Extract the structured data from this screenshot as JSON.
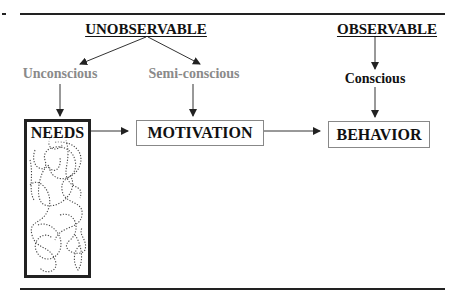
{
  "diagram": {
    "headers": {
      "unobservable": "UNOBSERVABLE",
      "observable": "OBSERVABLE"
    },
    "levels": {
      "unconscious": "Unconscious",
      "semi_conscious": "Semi-conscious",
      "conscious": "Conscious"
    },
    "boxes": {
      "needs": "NEEDS",
      "motivation": "MOTIVATION",
      "behavior": "BEHAVIOR"
    },
    "colors": {
      "line": "#222222",
      "gray_text": "#8a8a8a",
      "black_text": "#111111",
      "box_border_thin": "#888888"
    },
    "edges": [
      {
        "from": "UNOBSERVABLE",
        "to": "Unconscious"
      },
      {
        "from": "UNOBSERVABLE",
        "to": "Semi-conscious"
      },
      {
        "from": "Unconscious",
        "to": "NEEDS"
      },
      {
        "from": "Semi-conscious",
        "to": "MOTIVATION"
      },
      {
        "from": "OBSERVABLE",
        "to": "Conscious"
      },
      {
        "from": "Conscious",
        "to": "BEHAVIOR"
      },
      {
        "from": "NEEDS",
        "to": "MOTIVATION"
      },
      {
        "from": "MOTIVATION",
        "to": "BEHAVIOR"
      }
    ]
  }
}
